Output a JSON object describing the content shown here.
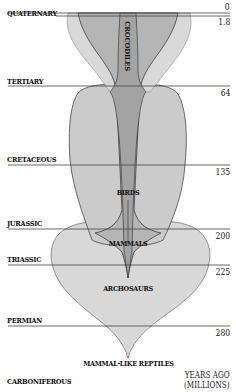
{
  "diagram": {
    "type": "phylogenetic-spindle-diagram",
    "colors": {
      "light_fill": "#dadada",
      "mid_fill": "#c2c2c2",
      "dark_fill": "#a9a9a9",
      "outline": "#333333",
      "rule": "#444444"
    },
    "periods": [
      {
        "name": "QUATERNARY",
        "age": "0",
        "age2": "1.8"
      },
      {
        "name": "TERTIARY",
        "age": "64"
      },
      {
        "name": "CRETACEOUS",
        "age": "135"
      },
      {
        "name": "JURASSIC",
        "age": "200"
      },
      {
        "name": "TRIASSIC",
        "age": "225"
      },
      {
        "name": "PERMIAN",
        "age": "280"
      },
      {
        "name": "CARBONIFEROUS"
      }
    ],
    "clades": [
      {
        "name": "CROCODILES"
      },
      {
        "name": "BIRDS"
      },
      {
        "name": "MAMMALS"
      },
      {
        "name": "ARCHOSAURS"
      },
      {
        "name": "MAMMAL-LIKE REPTILES"
      }
    ],
    "units": {
      "line1": "YEARS AGO",
      "line2": "(MILLIONS)"
    }
  }
}
